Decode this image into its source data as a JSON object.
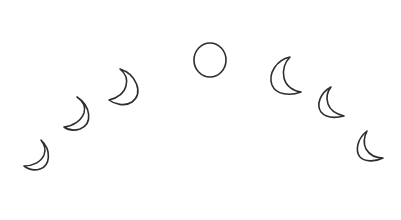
{
  "illustration": {
    "title": "Moon phases arc",
    "background": "#ffffff",
    "stroke_color": "#2e2e2e",
    "stroke_width": 1.6,
    "phases": [
      {
        "name": "waxing-crescent-thin",
        "shape": "crescent",
        "path": "M41 140 C52 150 50 166 40 169 C34 171 28 169 24 166 C33 166 41 162 44 155 C46 150 45 145 41 140 Z"
      },
      {
        "name": "waxing-crescent",
        "shape": "crescent",
        "path": "M77 97 C91 106 93 124 80 129 C74 131 68 130 64 127 C73 126 81 121 84 113 C86 106 83 101 77 97 Z"
      },
      {
        "name": "waxing-crescent-wide",
        "shape": "crescent",
        "path": "M120 69 C136 74 144 93 132 102 C125 107 114 104 109 100 C117 98 124 94 126 86 C128 79 125 73 120 69 Z"
      },
      {
        "name": "full-moon",
        "shape": "circle",
        "cx": 210,
        "cy": 60,
        "rx": 16,
        "ry": 17
      },
      {
        "name": "waning-crescent-wide",
        "shape": "crescent",
        "path": "M290 57 C276 60 268 74 272 85 C276 95 290 96 301 92 C293 91 286 86 284 78 C282 70 285 62 290 57 Z"
      },
      {
        "name": "waning-crescent",
        "shape": "crescent",
        "path": "M331 87 C320 93 316 105 321 112 C326 118 336 118 344 116 C336 114 330 110 328 104 C326 98 327 92 331 87 Z"
      },
      {
        "name": "waning-crescent-thin",
        "shape": "crescent",
        "path": "M367 131 C357 139 355 151 360 157 C365 162 375 162 383 158 C375 158 369 154 366 149 C363 143 364 137 367 131 Z"
      }
    ]
  }
}
